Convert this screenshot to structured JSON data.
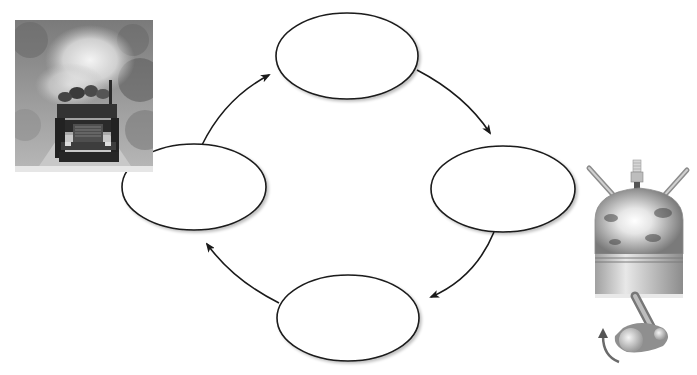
{
  "diagram": {
    "type": "cycle",
    "direction": "clockwise",
    "stroke_color": "#1a1a1a",
    "fill_color": "#ffffff",
    "nodes": [
      {
        "id": "top",
        "label": "",
        "cx": 347,
        "cy": 56,
        "rx": 71,
        "ry": 43
      },
      {
        "id": "right",
        "label": "",
        "cx": 503,
        "cy": 189,
        "rx": 72,
        "ry": 43
      },
      {
        "id": "bottom",
        "label": "",
        "cx": 348,
        "cy": 318,
        "rx": 71,
        "ry": 43
      },
      {
        "id": "left",
        "label": "",
        "cx": 194,
        "cy": 187,
        "rx": 72,
        "ry": 43
      }
    ],
    "edges": [
      {
        "from": "top",
        "to": "right"
      },
      {
        "from": "right",
        "to": "bottom"
      },
      {
        "from": "bottom",
        "to": "left"
      },
      {
        "from": "left",
        "to": "top"
      }
    ]
  },
  "images": {
    "truck_photo": {
      "description": "logging truck on dirt road with dust cloud, grayscale"
    },
    "engine_illustration": {
      "description": "engine cylinder with spark plug, valves, piston and crankshaft with rotation arrow"
    }
  }
}
